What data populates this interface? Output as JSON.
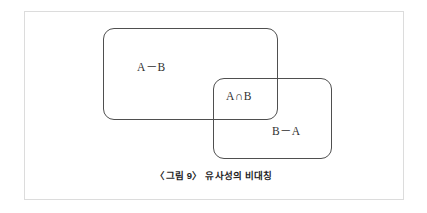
{
  "figure": {
    "caption": "〈그림 9〉 유사성의 비대칭",
    "frame_border_color": "#dcdcdc",
    "background_color": "#ffffff",
    "stroke_color": "#4f4f4f",
    "text_color": "#303030"
  },
  "diagram": {
    "type": "venn-two-set-rectangles",
    "sets": [
      {
        "id": "set-a",
        "name": "A",
        "shape": "rounded-rectangle",
        "x": 103,
        "y": 28,
        "width": 175,
        "height": 92
      },
      {
        "id": "set-b",
        "name": "B",
        "shape": "rounded-rectangle",
        "x": 213,
        "y": 78,
        "width": 119,
        "height": 81
      }
    ],
    "regions": [
      {
        "id": "a-minus-b",
        "label": "A－B",
        "meaning": "A difference B"
      },
      {
        "id": "a-intersect-b",
        "label": "A∩B",
        "meaning": "A intersection B"
      },
      {
        "id": "b-minus-a",
        "label": "B－A",
        "meaning": "B difference A"
      }
    ]
  }
}
